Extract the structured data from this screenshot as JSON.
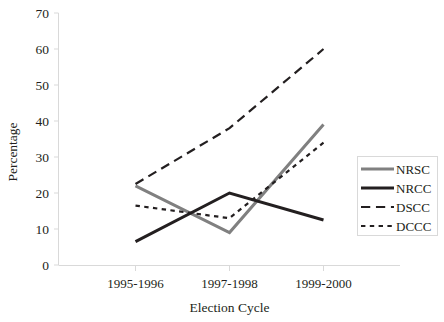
{
  "chart_data": {
    "type": "line",
    "title": "",
    "xlabel": "Election Cycle",
    "ylabel": "Percentage",
    "categories": [
      "1995-1996",
      "1997-1998",
      "1999-2000"
    ],
    "ylim": [
      0,
      70
    ],
    "yticks": [
      0,
      10,
      20,
      30,
      40,
      50,
      60,
      70
    ],
    "grid": false,
    "legend_position": "right",
    "series": [
      {
        "name": "NRSC",
        "values": [
          22,
          9,
          39
        ],
        "color": "#808080",
        "style": "solid",
        "width": 3
      },
      {
        "name": "NRCC",
        "values": [
          6.5,
          20,
          12.5
        ],
        "color": "#231f20",
        "style": "solid",
        "width": 3
      },
      {
        "name": "DSCC",
        "values": [
          22.5,
          38,
          60
        ],
        "color": "#231f20",
        "style": "long-dash",
        "width": 2.2
      },
      {
        "name": "DCCC",
        "values": [
          16.5,
          13,
          34
        ],
        "color": "#231f20",
        "style": "dotted",
        "width": 2.2
      }
    ]
  },
  "axes": {
    "y_tick_labels": [
      "0",
      "10",
      "20",
      "30",
      "40",
      "50",
      "60",
      "70"
    ],
    "x_tick_labels": [
      "1995-1996",
      "1997-1998",
      "1999-2000"
    ],
    "y_axis_title": "Percentage",
    "x_axis_title": "Election Cycle"
  },
  "legend": {
    "entries": [
      {
        "label": "NRSC"
      },
      {
        "label": "NRCC"
      },
      {
        "label": "DSCC"
      },
      {
        "label": "DCCC"
      }
    ]
  },
  "colors": {
    "series_gray": "#808080",
    "series_black": "#231f20",
    "axis": "#d9d9d9",
    "background": "#ffffff"
  }
}
